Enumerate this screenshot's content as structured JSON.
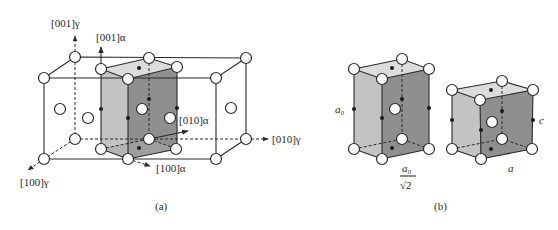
{
  "figure": {
    "panel_a": {
      "caption": "(a)",
      "axes": {
        "gamma_001": "[001]γ",
        "gamma_010": "[010]γ",
        "gamma_100": "[100]γ",
        "alpha_001": "[001]α",
        "alpha_010": "[010]α",
        "alpha_100": "[100]α"
      },
      "description": "Two adjacent FCC austenite (γ) unit cells with the body-centered tetragonal cell (α) outlined between them (Bain correspondence)."
    },
    "panel_b": {
      "caption": "(b)",
      "labels": {
        "a0": "a₀",
        "a0_over_sqrt2_num": "a₀",
        "a0_over_sqrt2_den": "√2",
        "c": "c",
        "a": "a"
      },
      "description": "Body-centered tetragonal cell in austenite (left) contracts to martensite cell (right)."
    },
    "colors": {
      "line": "#2a2a2a",
      "face_light": "#c8c8c8",
      "face_dark": "#9a9a9a",
      "face_top": "#dedede",
      "atom_fill": "#ffffff",
      "carbon": "#1a1a1a"
    }
  }
}
